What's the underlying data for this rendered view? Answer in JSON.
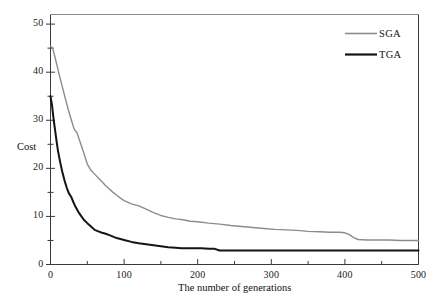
{
  "chart_data": {
    "type": "line",
    "title": "",
    "xlabel": "The number of generations",
    "ylabel": "Cost",
    "xlim": [
      0,
      500
    ],
    "ylim": [
      0,
      52
    ],
    "grid": false,
    "legend_position": "top-right",
    "x_ticks_major": [
      0,
      100,
      200,
      300,
      400,
      500
    ],
    "x_ticks_minor": [
      50,
      150,
      250,
      350,
      450
    ],
    "y_ticks_major": [
      0,
      10,
      20,
      30,
      40,
      50
    ],
    "y_ticks_minor": [
      5,
      15,
      25,
      35,
      45
    ],
    "x_tick_labels": [
      "0",
      "100",
      "200",
      "300",
      "400",
      "500"
    ],
    "y_tick_labels": [
      "0",
      "10",
      "20",
      "30",
      "40",
      "50"
    ],
    "series": [
      {
        "name": "SGA",
        "color": "#8c8c8c",
        "width": 1.4,
        "x": [
          0,
          3,
          6,
          9,
          12,
          16,
          20,
          24,
          28,
          32,
          36,
          40,
          45,
          50,
          55,
          60,
          65,
          70,
          75,
          80,
          85,
          90,
          95,
          100,
          110,
          120,
          130,
          140,
          150,
          160,
          170,
          180,
          190,
          200,
          215,
          230,
          245,
          260,
          275,
          290,
          305,
          320,
          335,
          350,
          365,
          380,
          392,
          400,
          406,
          412,
          418,
          430,
          445,
          460,
          475,
          490,
          500
        ],
        "y": [
          45.4,
          45.0,
          43.2,
          41.3,
          39.4,
          37.0,
          34.6,
          32.3,
          30.2,
          28.2,
          27.4,
          25.6,
          23.3,
          20.9,
          19.6,
          18.8,
          18.0,
          17.2,
          16.4,
          15.7,
          15.0,
          14.4,
          13.8,
          13.3,
          12.6,
          12.2,
          11.5,
          10.8,
          10.2,
          9.8,
          9.5,
          9.3,
          9.0,
          8.9,
          8.6,
          8.4,
          8.1,
          7.9,
          7.7,
          7.5,
          7.3,
          7.2,
          7.1,
          6.9,
          6.8,
          6.7,
          6.7,
          6.6,
          6.2,
          5.6,
          5.2,
          5.1,
          5.1,
          5.1,
          5.0,
          5.0,
          5.0
        ]
      },
      {
        "name": "TGA",
        "color": "#141414",
        "width": 2.0,
        "x": [
          0,
          2,
          4,
          6,
          8,
          10,
          13,
          16,
          19,
          22,
          25,
          28,
          31,
          34,
          38,
          42,
          46,
          50,
          55,
          60,
          65,
          70,
          75,
          80,
          85,
          90,
          95,
          100,
          110,
          120,
          130,
          140,
          150,
          160,
          170,
          178,
          185,
          195,
          205,
          215,
          222,
          230,
          245,
          265,
          285,
          305,
          330,
          360,
          390,
          420,
          450,
          475,
          500
        ],
        "y": [
          35.0,
          33.2,
          30.5,
          28.2,
          25.9,
          23.8,
          21.4,
          19.3,
          17.5,
          16.0,
          14.8,
          14.1,
          13.0,
          12.0,
          10.9,
          10.0,
          9.2,
          8.6,
          7.9,
          7.2,
          6.9,
          6.6,
          6.4,
          6.1,
          5.8,
          5.5,
          5.3,
          5.1,
          4.7,
          4.4,
          4.2,
          4.0,
          3.8,
          3.6,
          3.5,
          3.4,
          3.4,
          3.4,
          3.4,
          3.3,
          3.3,
          2.9,
          2.9,
          2.9,
          2.9,
          2.9,
          2.9,
          2.9,
          2.9,
          2.9,
          2.9,
          2.9,
          2.9
        ]
      }
    ]
  },
  "legend": {
    "items": [
      {
        "label": "SGA",
        "color": "#8c8c8c"
      },
      {
        "label": "TGA",
        "color": "#141414"
      }
    ]
  },
  "axes": {
    "y_title": "Cost",
    "x_title": "The number of generations"
  }
}
